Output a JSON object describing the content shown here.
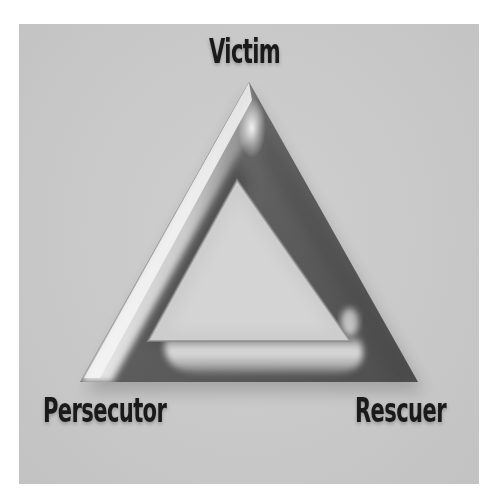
{
  "diagram": {
    "nodes": [
      {
        "id": "victim",
        "label": "Victim",
        "position": "top"
      },
      {
        "id": "persecutor",
        "label": "Persecutor",
        "position": "bottom-left"
      },
      {
        "id": "rescuer",
        "label": "Rescuer",
        "position": "bottom-right"
      }
    ],
    "colors": {
      "background": "#ffffff",
      "panel": "#c9c9c9",
      "triangle_dark": "#5a5a5a",
      "triangle_light": "#e8e8e8",
      "label_text": "#1a1a1a"
    }
  }
}
